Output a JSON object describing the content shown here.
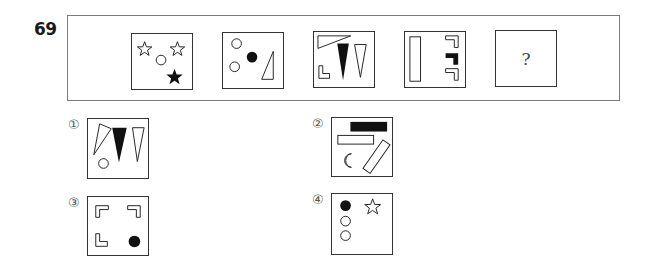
{
  "question": {
    "number": "69",
    "sequence": [
      {
        "id": 1,
        "content": [
          "outline-star",
          "outline-star",
          "outline-circle",
          "filled-star"
        ]
      },
      {
        "id": 2,
        "content": [
          "outline-circle",
          "outline-circle",
          "filled-circle",
          "outline-right-triangle"
        ]
      },
      {
        "id": 3,
        "content": [
          "outline-long-triangle",
          "filled-triangle",
          "outline-triangle",
          "outline-L-shape"
        ]
      },
      {
        "id": 4,
        "content": [
          "outline-rectangle",
          "outline-L-shape",
          "filled-L-shape",
          "outline-L-shape"
        ]
      },
      {
        "id": 5,
        "content": [
          "question-mark"
        ],
        "label": "?"
      }
    ]
  },
  "options": [
    {
      "label": "①",
      "content": [
        "outline-long-triangle",
        "filled-triangle",
        "outline-triangle",
        "outline-circle"
      ]
    },
    {
      "label": "②",
      "content": [
        "filled-rectangle",
        "outline-rectangle",
        "outline-tilted-rectangle",
        "outline-crescent"
      ]
    },
    {
      "label": "③",
      "content": [
        "outline-L-shape",
        "outline-L-shape",
        "outline-L-shape",
        "filled-circle"
      ]
    },
    {
      "label": "④",
      "content": [
        "filled-circle",
        "outline-star",
        "outline-circle",
        "outline-circle"
      ]
    }
  ]
}
